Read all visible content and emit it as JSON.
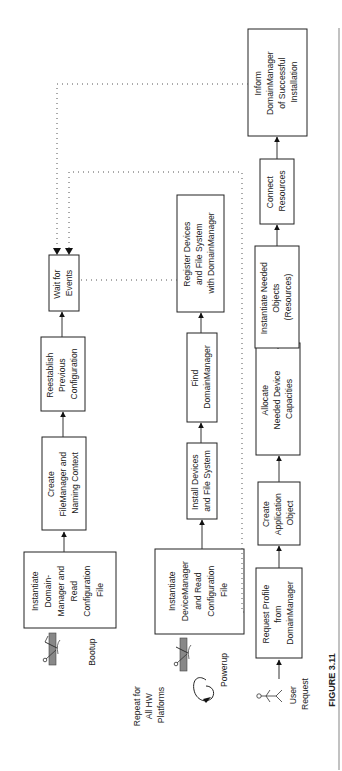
{
  "figure": {
    "caption": "FIGURE 3.11"
  },
  "colors": {
    "ink": "#222222",
    "background": "#ffffff",
    "rule": "#999999"
  },
  "diagram": {
    "nodes": [
      {
        "id": "inst_domain_mgr",
        "lines": [
          "Instantiate",
          "Domain-",
          "Manager and",
          "Read",
          "Configuration",
          "File"
        ]
      },
      {
        "id": "create_filemgr",
        "lines": [
          "Create",
          "FileManager and",
          "Naming Context"
        ]
      },
      {
        "id": "reestablish",
        "lines": [
          "Reestablish",
          "Previous",
          "Configuration"
        ]
      },
      {
        "id": "wait_events",
        "lines": [
          "Wait for",
          "Events"
        ]
      },
      {
        "id": "inst_device_mgr",
        "lines": [
          "Instantiate",
          "DeviceManager",
          "and Read",
          "Configuration",
          "File"
        ]
      },
      {
        "id": "install_devices",
        "lines": [
          "Install Devices",
          "and File System"
        ]
      },
      {
        "id": "find_domain_mgr",
        "lines": [
          "Find",
          "DomainManager"
        ]
      },
      {
        "id": "register_devices",
        "lines": [
          "Register Devices",
          "and File System",
          "with DomainManager"
        ]
      },
      {
        "id": "request_profile",
        "lines": [
          "Request Profile",
          "from",
          "DomainManager"
        ]
      },
      {
        "id": "create_app_obj",
        "lines": [
          "Create",
          "Application",
          "Object"
        ]
      },
      {
        "id": "allocate_caps",
        "lines": [
          "Allocate",
          "Needed Device",
          "Capacities"
        ]
      },
      {
        "id": "inst_needed_objs",
        "lines": [
          "Instantiate Needed",
          "Objects",
          "(Resources)"
        ]
      },
      {
        "id": "connect_resources",
        "lines": [
          "Connect",
          "Resources"
        ]
      },
      {
        "id": "inform_domain_mgr",
        "lines": [
          "Inform",
          "DomainManager",
          "of Successful",
          "Installation"
        ]
      }
    ],
    "labels": {
      "bootup": "Bootup",
      "powerup": "Powerup",
      "repeat": [
        "Repeat for",
        "All HW",
        "Platforms"
      ],
      "user_request": [
        "User",
        "Request"
      ]
    },
    "edges": [
      {
        "from": "inst_domain_mgr",
        "to": "create_filemgr",
        "style": "solid"
      },
      {
        "from": "create_filemgr",
        "to": "reestablish",
        "style": "solid"
      },
      {
        "from": "reestablish",
        "to": "wait_events",
        "style": "solid"
      },
      {
        "from": "inst_device_mgr",
        "to": "install_devices",
        "style": "solid"
      },
      {
        "from": "install_devices",
        "to": "find_domain_mgr",
        "style": "solid"
      },
      {
        "from": "find_domain_mgr",
        "to": "register_devices",
        "style": "solid"
      },
      {
        "from": "register_devices",
        "to": "wait_events",
        "style": "dotted"
      },
      {
        "from": "user_request",
        "to": "request_profile",
        "style": "solid"
      },
      {
        "from": "request_profile",
        "to": "create_app_obj",
        "style": "solid"
      },
      {
        "from": "create_app_obj",
        "to": "allocate_caps",
        "style": "solid"
      },
      {
        "from": "allocate_caps",
        "to": "inst_needed_objs",
        "style": "solid"
      },
      {
        "from": "inst_needed_objs",
        "to": "connect_resources",
        "style": "solid"
      },
      {
        "from": "connect_resources",
        "to": "inform_domain_mgr",
        "style": "solid"
      },
      {
        "from": "request_profile",
        "to": "wait_events",
        "style": "dotted"
      },
      {
        "from": "inform_domain_mgr",
        "to": "wait_events",
        "style": "dotted"
      }
    ]
  }
}
